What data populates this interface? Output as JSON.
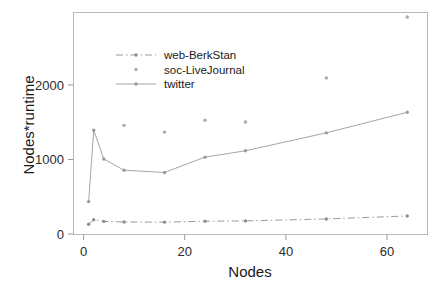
{
  "chart_data": {
    "type": "line",
    "title": "",
    "xlabel": "Nodes",
    "ylabel": "Nodes*runtime",
    "xlim": [
      -2,
      68
    ],
    "ylim": [
      -120,
      2850
    ],
    "xticks": [
      0,
      20,
      40,
      60
    ],
    "xtick_labels": [
      "0",
      "20",
      "40",
      "60"
    ],
    "yticks": [
      0,
      1000,
      2000
    ],
    "ytick_labels": [
      "0",
      "1000",
      "2000"
    ],
    "grid": false,
    "legend_position": "upper-left-inside",
    "x": [
      1,
      2,
      4,
      8,
      16,
      24,
      32,
      48,
      64
    ],
    "series": [
      {
        "name": "web-BerkStan",
        "color": "#8f8f8f",
        "linestyle": "dashdot",
        "marker": "dot",
        "values": [
          18,
          78,
          55,
          48,
          45,
          58,
          62,
          88,
          128
        ]
      },
      {
        "name": "soc-LiveJournal",
        "color": "#a8a8a8",
        "linestyle": "none",
        "marker": "dot",
        "values": [
          null,
          null,
          null,
          1340,
          1250,
          1410,
          1385,
          1975,
          2790
        ]
      },
      {
        "name": "twitter",
        "color": "#9b9b9b",
        "linestyle": "solid",
        "marker": "dot",
        "values": [
          320,
          1275,
          890,
          740,
          710,
          915,
          1000,
          1240,
          1515
        ]
      }
    ]
  },
  "axes": {
    "x_title": "Nodes",
    "y_title": "Nodes*runtime"
  },
  "legend": {
    "items": [
      {
        "label": "web-BerkStan"
      },
      {
        "label": "soc-LiveJournal"
      },
      {
        "label": "twitter"
      }
    ]
  },
  "colors": {
    "background": "#ffffff",
    "frame": "#b9b9b9",
    "text": "#1a1a1a",
    "series_web_berkstan": "#8f8f8f",
    "series_soc_livejournal": "#a8a8a8",
    "series_twitter": "#9b9b9b"
  }
}
